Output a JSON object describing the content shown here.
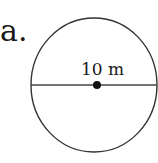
{
  "figure": {
    "label": "a.",
    "shape": "circle",
    "measurement_label": "10 m",
    "measurement_type": "diameter",
    "colors": {
      "stroke": "#333333",
      "text": "#1a1a1a",
      "background": "#ffffff"
    }
  }
}
